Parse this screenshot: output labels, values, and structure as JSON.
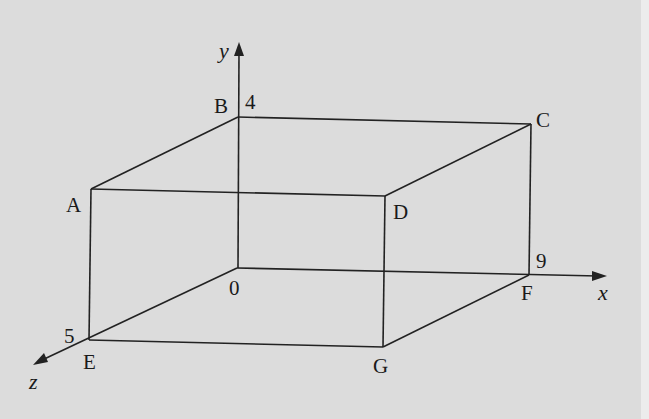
{
  "figure": {
    "type": "3D cuboid on coordinate axes",
    "background": "#dcdcdc",
    "stroke_color": "#222222"
  },
  "axes": {
    "x": {
      "label": "x"
    },
    "y": {
      "label": "y"
    },
    "z": {
      "label": "z"
    }
  },
  "vertices": {
    "A": "A",
    "B": "B",
    "C": "C",
    "D": "D",
    "E": "E",
    "F": "F",
    "G": "G",
    "O": "0"
  },
  "tick_values": {
    "y": "4",
    "x": "9",
    "z": "5"
  }
}
